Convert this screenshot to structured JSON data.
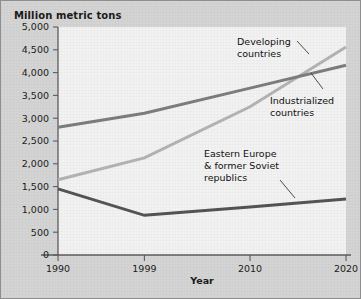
{
  "figure": {
    "title": "Million metric tons",
    "background_color": "#d4d4d4",
    "plot_background_color": "#f2f2f2",
    "border_color": "#8e8e8e"
  },
  "chart_data": {
    "type": "line",
    "title": "Million metric tons",
    "xlabel": "Year",
    "ylabel": "Million metric tons",
    "x": [
      1990,
      1999,
      2010,
      2020
    ],
    "categories": [
      "1990",
      "1999",
      "2010",
      "2020"
    ],
    "xlim": [
      1990,
      2020
    ],
    "ylim": [
      0,
      5000
    ],
    "ytick_values": [
      0,
      500,
      1000,
      1500,
      2000,
      2500,
      3000,
      3500,
      4000,
      4500,
      5000
    ],
    "ytick_labels": [
      "0",
      "500",
      "1,000",
      "1,500",
      "2,000",
      "2,500",
      "3,000",
      "3,500",
      "4,000",
      "4,500",
      "5,000"
    ],
    "xtick_labels": [
      "1990",
      "1999",
      "2010",
      "2020"
    ],
    "grid": false,
    "legend": "annotations",
    "series": [
      {
        "name": "Developing countries",
        "color": "#b3b3b3",
        "values": [
          1650,
          2130,
          3250,
          4560
        ]
      },
      {
        "name": "Industrialized countries",
        "color": "#7d7d7d",
        "values": [
          2800,
          3110,
          3660,
          4160
        ]
      },
      {
        "name": "Eastern Europe & former Soviet republics",
        "color": "#545454",
        "values": [
          1450,
          870,
          1050,
          1230
        ]
      }
    ],
    "annotations": [
      {
        "id": "developing",
        "lines": [
          "Developing",
          "countries"
        ]
      },
      {
        "id": "industrialized",
        "lines": [
          "Industrialized",
          "countries"
        ]
      },
      {
        "id": "eastern-europe",
        "lines": [
          "Eastern Europe",
          "& former Soviet",
          "republics"
        ]
      }
    ]
  }
}
